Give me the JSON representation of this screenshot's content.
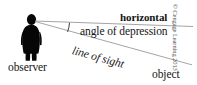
{
  "diagram": {
    "background_color": "#ffffff",
    "line_color": "#8c8c8c",
    "figure_color": "#000000",
    "labels": {
      "horizontal": "horizontal",
      "angle_of_depression": "angle of depression",
      "line_of_sight": "line of sight",
      "observer": "observer",
      "object": "object"
    },
    "credit": "© Cengage Learning 2013",
    "geometry": {
      "vertex": [
        33,
        21
      ],
      "horizontal_end": [
        192,
        26
      ],
      "line_of_sight_end": [
        186,
        63
      ],
      "angle_arc_center": [
        33,
        21
      ],
      "angle_arc_radius": 36
    }
  }
}
